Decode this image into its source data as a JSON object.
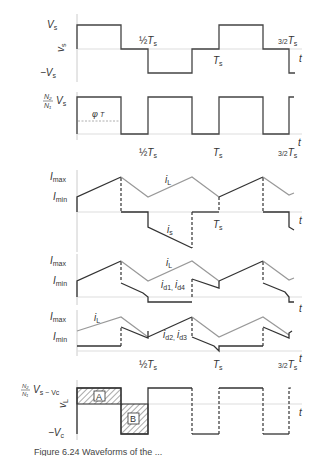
{
  "figure": {
    "caption": "Figure 6.24   Waveforms of the ..."
  },
  "panels": [
    {
      "id": "v-primary",
      "ylabel": "v_s",
      "levels": [
        "V_s",
        "-V_s"
      ],
      "x_labels": [
        "1/2 T_s",
        "T_s",
        "3/2 T_s"
      ],
      "t_label": "t"
    },
    {
      "id": "v-secondary",
      "ylabel": "",
      "levels": [
        "N2/N1 V_s"
      ],
      "annotation": "phi T_s/2",
      "x_labels": [
        "1/2 T_s",
        "T_s",
        "3/2 T_s"
      ],
      "t_label": "t"
    },
    {
      "id": "i-switch",
      "levels": [
        "I_max",
        "I_min"
      ],
      "curves": [
        "i_L",
        "i_s"
      ],
      "x_labels": [
        "T_s"
      ],
      "t_label": "t"
    },
    {
      "id": "i-d1-d4",
      "levels": [
        "I_max",
        "I_min"
      ],
      "curves": [
        "i_L",
        "i_d1, i_d4"
      ],
      "t_label": "t"
    },
    {
      "id": "i-d2-d3",
      "levels": [
        "I_max",
        "I_min"
      ],
      "curves": [
        "i_L",
        "i_d2, i_d3"
      ],
      "x_labels": [
        "1/2 T_s",
        "T_s",
        "3/2 T_s"
      ],
      "t_label": "t"
    },
    {
      "id": "v-inductor",
      "ylabel": "v_L",
      "levels": [
        "N2/N1 V_s - V_c",
        "-V_c"
      ],
      "areas": [
        "A",
        "B"
      ],
      "t_label": "t"
    }
  ],
  "labels": {
    "Vs": "V",
    "Vs_sub": "s",
    "negVs": "−V",
    "vs_axis": "v",
    "vs_axis_sub": "s",
    "half": "½",
    "Ts": "T",
    "Ts_sub": "s",
    "three_half": "3/2",
    "t": "t",
    "N2": "N₂",
    "N1": "N₁",
    "phi": "φ",
    "Imax": "I",
    "max": "max",
    "Imin": "I",
    "min": "min",
    "iL": "i",
    "iL_sub": "L",
    "is": "i",
    "is_sub": "s",
    "id14": "i",
    "d1": "d1, ",
    "id4": "i",
    "d4": "d4",
    "id23": "i",
    "d2": "d2, ",
    "id3": "i",
    "d3": "d3",
    "vL": "v",
    "vL_sub": "L",
    "minus_Vc": "−V",
    "c": "c",
    "Vs_minus": "V",
    "s_minus": "s − V",
    "A": "A",
    "B": "B"
  }
}
